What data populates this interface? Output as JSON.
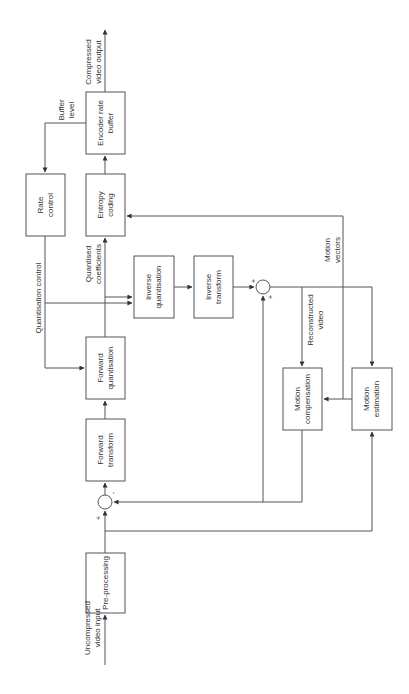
{
  "diagram": {
    "orientation": "rotated-90-ccw",
    "blocks": {
      "pre_processing": [
        "Pre-processing"
      ],
      "forward_transform": [
        "Forward",
        "transform"
      ],
      "forward_quantisation": [
        "Forward",
        "quantisation"
      ],
      "entropy_coding": [
        "Entropy",
        "coding"
      ],
      "encoder_rate_buffer": [
        "Encoder rate",
        "buffer"
      ],
      "rate_control": [
        "Rate",
        "control"
      ],
      "inverse_quantisation": [
        "Inverse",
        "quantisation"
      ],
      "inverse_transform": [
        "Inverse",
        "transform"
      ],
      "motion_compensation": [
        "Motion",
        "compensation"
      ],
      "motion_estimation": [
        "Motion",
        "estimation"
      ]
    },
    "signals": {
      "input": [
        "Uncompressed",
        "video input"
      ],
      "output": [
        "Compressed",
        "video output"
      ],
      "buffer_level": [
        "Buffer",
        "level"
      ],
      "quantisation_control": [
        "Quantisation control"
      ],
      "quantised_coefficients": [
        "Quantised",
        "coefficients"
      ],
      "motion_vectors": [
        "Motion",
        "vectors"
      ],
      "reconstructed_video": [
        "Reconstructed",
        "video"
      ]
    },
    "signs": {
      "subtractor_plus": "+",
      "subtractor_minus": "-",
      "adder_plus_a": "+",
      "adder_plus_b": "+"
    },
    "colors": {
      "line": "#555555",
      "text": "#333333",
      "background": "#ffffff"
    }
  }
}
